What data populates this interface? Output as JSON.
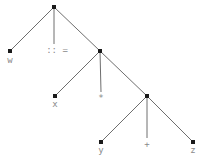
{
  "diagram": {
    "type": "parse-tree",
    "colors": {
      "edge": "#6e6e6e",
      "node": "#1a1a1a",
      "label": "#8a8a8a",
      "background": "#ffffff"
    },
    "nodes": [
      {
        "id": "root",
        "x": 54,
        "y": 7,
        "label": ""
      },
      {
        "id": "w",
        "x": 10,
        "y": 51,
        "label": "w"
      },
      {
        "id": "assign",
        "x": 54,
        "y": 51,
        "label": "::="
      },
      {
        "id": "n1",
        "x": 100,
        "y": 51,
        "label": ""
      },
      {
        "id": "x",
        "x": 55,
        "y": 96,
        "label": "x"
      },
      {
        "id": "times",
        "x": 101,
        "y": 96,
        "label": "*"
      },
      {
        "id": "n2",
        "x": 147,
        "y": 96,
        "label": ""
      },
      {
        "id": "y",
        "x": 101,
        "y": 142,
        "label": "y"
      },
      {
        "id": "plus",
        "x": 147,
        "y": 142,
        "label": "+"
      },
      {
        "id": "z",
        "x": 193,
        "y": 142,
        "label": "z"
      }
    ],
    "edges": [
      [
        "root",
        "w"
      ],
      [
        "root",
        "assign"
      ],
      [
        "root",
        "n1"
      ],
      [
        "n1",
        "x"
      ],
      [
        "n1",
        "times"
      ],
      [
        "n1",
        "n2"
      ],
      [
        "n2",
        "y"
      ],
      [
        "n2",
        "plus"
      ],
      [
        "n2",
        "z"
      ]
    ],
    "leaf_labels": {
      "w": "w",
      "assign": ":: =",
      "x": "x",
      "times": "*",
      "y": "y",
      "plus": "+",
      "z": "z"
    }
  }
}
